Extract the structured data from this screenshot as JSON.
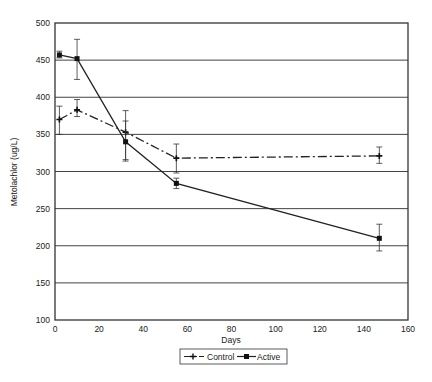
{
  "chart_data": {
    "type": "line",
    "title": "",
    "xlabel": "Days",
    "ylabel": "Metolachlor (ug/L)",
    "xlim": [
      0,
      160
    ],
    "ylim": [
      100,
      500
    ],
    "xticks": [
      0,
      20,
      40,
      60,
      80,
      100,
      120,
      140,
      160
    ],
    "yticks": [
      100,
      150,
      200,
      250,
      300,
      350,
      400,
      450,
      500
    ],
    "grid": "horizontal",
    "legend_position": "bottom",
    "series": [
      {
        "name": "Control",
        "style": "dash-dot",
        "marker": "plus",
        "x": [
          2,
          10,
          32,
          55,
          147
        ],
        "values": [
          370,
          383,
          353,
          318,
          321
        ],
        "error_low": [
          350,
          374,
          316,
          298,
          311
        ],
        "error_high": [
          388,
          397,
          382,
          337,
          333
        ]
      },
      {
        "name": "Active",
        "style": "solid",
        "marker": "square",
        "x": [
          2,
          10,
          32,
          55,
          147
        ],
        "values": [
          457,
          452,
          340,
          284,
          210
        ],
        "error_low": [
          453,
          424,
          314,
          277,
          193
        ],
        "error_high": [
          462,
          478,
          368,
          291,
          229
        ]
      }
    ]
  }
}
